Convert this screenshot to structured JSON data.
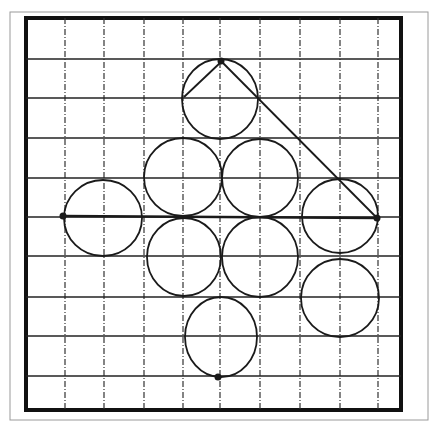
{
  "figure": {
    "outer_frame": {
      "x": 10,
      "y": 12,
      "w": 418,
      "h": 408,
      "color": "#9a9a9a"
    },
    "inner_frame": {
      "x": 26,
      "y": 18,
      "w": 375,
      "h": 392,
      "color": "#111111",
      "stroke": 4
    },
    "vertical_dashed_lines_x": [
      65,
      104,
      144,
      183,
      220,
      260,
      300,
      340,
      378
    ],
    "horizontal_lines_y": [
      59,
      98,
      138,
      178,
      217,
      256,
      297,
      336,
      376
    ],
    "circles": [
      {
        "cx": 220,
        "cy": 99,
        "rx": 38,
        "ry": 40
      },
      {
        "cx": 183,
        "cy": 177,
        "rx": 39,
        "ry": 39
      },
      {
        "cx": 260,
        "cy": 178,
        "rx": 38,
        "ry": 39
      },
      {
        "cx": 103,
        "cy": 218,
        "rx": 39,
        "ry": 38
      },
      {
        "cx": 340,
        "cy": 216,
        "rx": 38,
        "ry": 37
      },
      {
        "cx": 184,
        "cy": 257,
        "rx": 37,
        "ry": 39
      },
      {
        "cx": 260,
        "cy": 257,
        "rx": 38,
        "ry": 40
      },
      {
        "cx": 340,
        "cy": 298,
        "rx": 39,
        "ry": 39
      },
      {
        "cx": 221,
        "cy": 337,
        "rx": 36,
        "ry": 40
      }
    ],
    "dots": [
      {
        "name": "top-dot",
        "x": 221,
        "y": 61
      },
      {
        "name": "left-dot",
        "x": 63,
        "y": 216
      },
      {
        "name": "right-dot",
        "x": 377,
        "y": 218
      },
      {
        "name": "bottom-dot",
        "x": 218,
        "y": 377
      }
    ],
    "lines": [
      {
        "name": "horizontal-axis-line",
        "x1": 63,
        "y1": 216,
        "x2": 377,
        "y2": 218
      },
      {
        "name": "diagonal-line",
        "x1": 221,
        "y1": 61,
        "x2": 377,
        "y2": 218
      },
      {
        "name": "left-slant-stroke",
        "x1": 184,
        "y1": 97,
        "x2": 221,
        "y2": 62
      }
    ],
    "ink_color": "#1a1a1a",
    "paper_color": "#ffffff"
  }
}
